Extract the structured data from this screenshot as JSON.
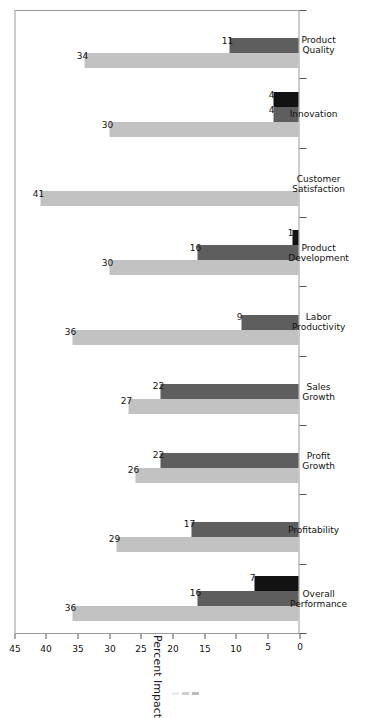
{
  "chart_data": {
    "type": "bar",
    "orientation": "vertical-rotated",
    "title": "",
    "xlabel": "",
    "ylabel": "Percent Impact",
    "ylim": [
      0,
      45
    ],
    "yticks": [
      "0",
      "5",
      "10",
      "15",
      "20",
      "25",
      "30",
      "35",
      "40",
      "45"
    ],
    "grid": false,
    "legend": "none-visible",
    "categories": [
      "Overall\nPerformance",
      "Profitability",
      "Profit\nGrowth",
      "Sales\nGrowth",
      "Labor\nProductivity",
      "Product\nDevelopment",
      "Customer\nSatisfaction",
      "Innovation",
      "Product\nQuality"
    ],
    "series": [
      {
        "name": "series-1",
        "color": "#c2c2c2",
        "values": [
          36,
          29,
          26,
          27,
          36,
          30,
          41,
          30,
          34
        ]
      },
      {
        "name": "series-2",
        "color": "#5e5e5e",
        "values": [
          16,
          17,
          22,
          22,
          9,
          16,
          0,
          4,
          11
        ]
      },
      {
        "name": "series-3",
        "color": "#121212",
        "values": [
          7,
          0,
          0,
          0,
          0,
          1,
          0,
          4,
          0
        ]
      }
    ]
  },
  "axis": {
    "value_axis_title": "Percent Impact",
    "ticks": [
      {
        "label": "45",
        "value": 45
      },
      {
        "label": "40",
        "value": 40
      },
      {
        "label": "35",
        "value": 35
      },
      {
        "label": "30",
        "value": 30
      },
      {
        "label": "25",
        "value": 25
      },
      {
        "label": "20",
        "value": 20
      },
      {
        "label": "15",
        "value": 15
      },
      {
        "label": "10",
        "value": 10
      },
      {
        "label": "5",
        "value": 5
      },
      {
        "label": "0",
        "value": 0
      }
    ]
  },
  "categories": [
    {
      "line1": "Overall",
      "line2": "Performance"
    },
    {
      "line1": "Profitability",
      "line2": ""
    },
    {
      "line1": "Profit",
      "line2": "Growth"
    },
    {
      "line1": "Sales",
      "line2": "Growth"
    },
    {
      "line1": "Labor",
      "line2": "Productivity"
    },
    {
      "line1": "Product",
      "line2": "Development"
    },
    {
      "line1": "Customer",
      "line2": "Satisfaction"
    },
    {
      "line1": "Innovation",
      "line2": ""
    },
    {
      "line1": "Product",
      "line2": "Quality"
    }
  ],
  "bar_labels": {
    "g0": [
      "36",
      "16",
      "7"
    ],
    "g1": [
      "29",
      "17",
      ""
    ],
    "g2": [
      "26",
      "22",
      ""
    ],
    "g3": [
      "27",
      "22",
      ""
    ],
    "g4": [
      "36",
      "9",
      ""
    ],
    "g5": [
      "30",
      "16",
      "1"
    ],
    "g6": [
      "41",
      "",
      ""
    ],
    "g7": [
      "30",
      "4",
      "4"
    ],
    "g8": [
      "34",
      "11",
      ""
    ]
  },
  "colors": {
    "series_1": "#c2c2c2",
    "series_2": "#5e5e5e",
    "series_3": "#121212",
    "frame": "#9a9a9a",
    "text": "#111111",
    "background": "#ffffff"
  }
}
